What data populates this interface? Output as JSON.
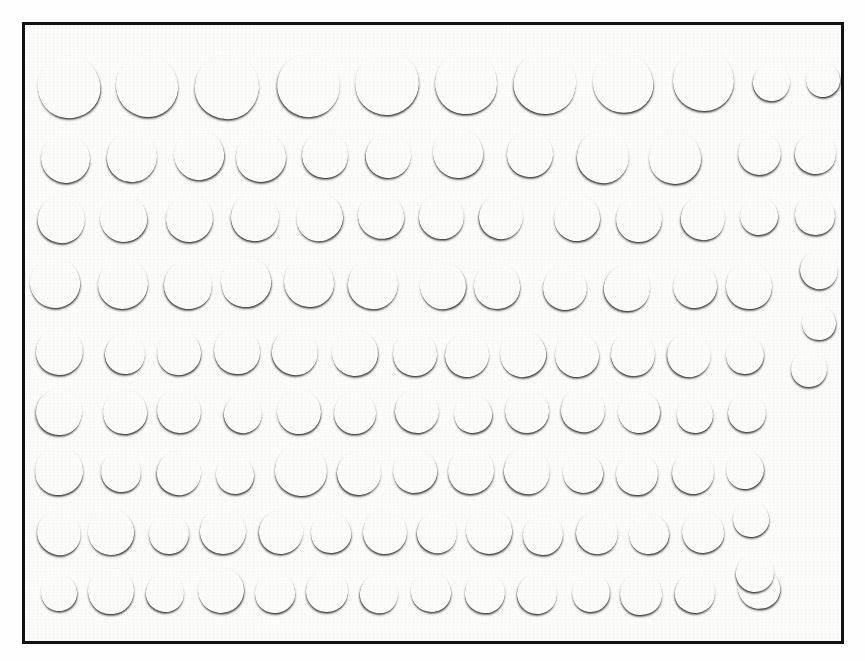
{
  "image": {
    "subject": "coin-hoard-photograph",
    "description": "Monochrome photograph of a hoard of hammered silver coins laid out in rows inside a ruled black rectangular frame",
    "orientation": "landscape",
    "background_color": "#fefefe",
    "frame_color": "#111111",
    "frame": {
      "left": 22,
      "top": 22,
      "width": 822,
      "height": 622,
      "border_width": 3
    },
    "total_coins": 120,
    "row_count": 9
  },
  "palette": {
    "paper": "#fcfcfa",
    "frame": "#111111",
    "coin_light": "#c3c1ba",
    "coin_mid": "#9d9b94",
    "coin_dark": "#74726c",
    "coin_darkest": "#5c5a55",
    "shadow": "rgba(0,0,0,0.55)"
  },
  "rows": [
    {
      "index": 1,
      "label": "row-1",
      "coin_count": 11,
      "note": "nine large coins followed by two small coins at the right",
      "coins": [
        {
          "cx": 66,
          "cy": 84,
          "d": 62,
          "tone": "#b4b2ab",
          "device": "plain"
        },
        {
          "cx": 144,
          "cy": 83,
          "d": 62,
          "tone": "#c2c0b8",
          "device": "bust"
        },
        {
          "cx": 224,
          "cy": 84,
          "d": 64,
          "tone": "#8b8982",
          "device": "plain"
        },
        {
          "cx": 305,
          "cy": 82,
          "d": 63,
          "tone": "#a9a7a0",
          "device": "bust"
        },
        {
          "cx": 384,
          "cy": 80,
          "d": 64,
          "tone": "#b0aea7",
          "device": "bust"
        },
        {
          "cx": 463,
          "cy": 80,
          "d": 62,
          "tone": "#aeaca5",
          "device": "bust"
        },
        {
          "cx": 542,
          "cy": 80,
          "d": 62,
          "tone": "#bcbab2",
          "device": "shield"
        },
        {
          "cx": 620,
          "cy": 80,
          "d": 60,
          "tone": "#838179",
          "device": "plain"
        },
        {
          "cx": 700,
          "cy": 77,
          "d": 61,
          "tone": "#c0beb6",
          "device": "plain"
        },
        {
          "cx": 768,
          "cy": 79,
          "d": 37,
          "tone": "#8c8a83",
          "device": "plain"
        },
        {
          "cx": 820,
          "cy": 77,
          "d": 34,
          "tone": "#908e87",
          "device": "plain"
        }
      ]
    },
    {
      "index": 2,
      "label": "row-2",
      "coin_count": 12,
      "coins": [
        {
          "cx": 62,
          "cy": 155,
          "d": 49,
          "tone": "#bab8b0",
          "device": "plain"
        },
        {
          "cx": 129,
          "cy": 154,
          "d": 50,
          "tone": "#a6a49d",
          "device": "shield"
        },
        {
          "cx": 196,
          "cy": 152,
          "d": 50,
          "tone": "#c0beb6",
          "device": "plain"
        },
        {
          "cx": 258,
          "cy": 154,
          "d": 50,
          "tone": "#9a9891",
          "device": "shield"
        },
        {
          "cx": 322,
          "cy": 152,
          "d": 46,
          "tone": "#b2b0a9",
          "device": "bust"
        },
        {
          "cx": 385,
          "cy": 152,
          "d": 45,
          "tone": "#b6b4ac",
          "device": "bust"
        },
        {
          "cx": 455,
          "cy": 150,
          "d": 50,
          "tone": "#a2a099",
          "device": "bust"
        },
        {
          "cx": 527,
          "cy": 151,
          "d": 46,
          "tone": "#bdbbb3",
          "device": "shield"
        },
        {
          "cx": 600,
          "cy": 154,
          "d": 52,
          "tone": "#8f8d86",
          "device": "cross"
        },
        {
          "cx": 672,
          "cy": 155,
          "d": 52,
          "tone": "#b7b5ad",
          "device": "shield"
        },
        {
          "cx": 756,
          "cy": 150,
          "d": 43,
          "tone": "#9d9b94",
          "device": "bust"
        },
        {
          "cx": 812,
          "cy": 150,
          "d": 41,
          "tone": "#878580",
          "device": "bust"
        }
      ]
    },
    {
      "index": 3,
      "label": "row-3",
      "coin_count": 13,
      "coins": [
        {
          "cx": 58,
          "cy": 216,
          "d": 47,
          "tone": "#a5a39c",
          "device": "plain"
        },
        {
          "cx": 120,
          "cy": 215,
          "d": 47,
          "tone": "#c4c2ba",
          "device": "plain"
        },
        {
          "cx": 186,
          "cy": 215,
          "d": 47,
          "tone": "#aeaca5",
          "device": "plain"
        },
        {
          "cx": 252,
          "cy": 214,
          "d": 48,
          "tone": "#b5b3ab",
          "device": "bust"
        },
        {
          "cx": 316,
          "cy": 214,
          "d": 47,
          "tone": "#9b9992",
          "device": "bust"
        },
        {
          "cx": 378,
          "cy": 213,
          "d": 46,
          "tone": "#8d8b84",
          "device": "plain"
        },
        {
          "cx": 438,
          "cy": 213,
          "d": 45,
          "tone": "#aaa8a1",
          "device": "bust"
        },
        {
          "cx": 498,
          "cy": 214,
          "d": 44,
          "tone": "#98968f",
          "device": "plain"
        },
        {
          "cx": 574,
          "cy": 215,
          "d": 46,
          "tone": "#a19f98",
          "device": "bust"
        },
        {
          "cx": 636,
          "cy": 216,
          "d": 46,
          "tone": "#b0aea6",
          "device": "cross"
        },
        {
          "cx": 700,
          "cy": 215,
          "d": 44,
          "tone": "#a3a19a",
          "device": "bust"
        },
        {
          "cx": 756,
          "cy": 213,
          "d": 38,
          "tone": "#8a8881",
          "device": "plain"
        },
        {
          "cx": 812,
          "cy": 212,
          "d": 40,
          "tone": "#747269",
          "device": "plain"
        }
      ]
    },
    {
      "index": 4,
      "label": "row-4",
      "coin_count": 14,
      "coins": [
        {
          "cx": 52,
          "cy": 280,
          "d": 50,
          "tone": "#8e8c85",
          "device": "plain"
        },
        {
          "cx": 120,
          "cy": 281,
          "d": 50,
          "tone": "#9c9a93",
          "device": "plain"
        },
        {
          "cx": 185,
          "cy": 282,
          "d": 48,
          "tone": "#c3c1b9",
          "device": "plain"
        },
        {
          "cx": 243,
          "cy": 279,
          "d": 50,
          "tone": "#b9b7af",
          "device": "plain"
        },
        {
          "cx": 306,
          "cy": 279,
          "d": 50,
          "tone": "#a8a69f",
          "device": "bust"
        },
        {
          "cx": 370,
          "cy": 281,
          "d": 50,
          "tone": "#929089",
          "device": "plain"
        },
        {
          "cx": 440,
          "cy": 283,
          "d": 46,
          "tone": "#a6a49d",
          "device": "shield"
        },
        {
          "cx": 494,
          "cy": 283,
          "d": 46,
          "tone": "#9a9891",
          "device": "cross"
        },
        {
          "cx": 562,
          "cy": 285,
          "d": 44,
          "tone": "#b1afa8",
          "device": "bust"
        },
        {
          "cx": 624,
          "cy": 285,
          "d": 46,
          "tone": "#a09e97",
          "device": "bust"
        },
        {
          "cx": 692,
          "cy": 283,
          "d": 44,
          "tone": "#7b7972",
          "device": "plain"
        },
        {
          "cx": 746,
          "cy": 283,
          "d": 46,
          "tone": "#87857e",
          "device": "plain"
        },
        {
          "cx": 816,
          "cy": 267,
          "d": 38,
          "tone": "#6e6c66",
          "device": "bust"
        },
        {
          "cx": 816,
          "cy": 320,
          "d": 34,
          "tone": "#6a6862",
          "device": "plain"
        }
      ]
    },
    {
      "index": 5,
      "label": "row-5",
      "coin_count": 14,
      "coins": [
        {
          "cx": 56,
          "cy": 348,
          "d": 47,
          "tone": "#b4b2aa",
          "device": "plain"
        },
        {
          "cx": 122,
          "cy": 351,
          "d": 40,
          "tone": "#a9a7a0",
          "device": "plain"
        },
        {
          "cx": 176,
          "cy": 350,
          "d": 44,
          "tone": "#8f8d86",
          "device": "plain"
        },
        {
          "cx": 234,
          "cy": 348,
          "d": 46,
          "tone": "#9b9992",
          "device": "bust"
        },
        {
          "cx": 292,
          "cy": 349,
          "d": 46,
          "tone": "#a6a49d",
          "device": "plain"
        },
        {
          "cx": 352,
          "cy": 350,
          "d": 46,
          "tone": "#a09e97",
          "device": "bust"
        },
        {
          "cx": 412,
          "cy": 351,
          "d": 44,
          "tone": "#8d8b84",
          "device": "bust"
        },
        {
          "cx": 464,
          "cy": 352,
          "d": 44,
          "tone": "#8a8881",
          "device": "shield"
        },
        {
          "cx": 520,
          "cy": 351,
          "d": 46,
          "tone": "#a3a19a",
          "device": "shield"
        },
        {
          "cx": 574,
          "cy": 352,
          "d": 44,
          "tone": "#97958e",
          "device": "bust"
        },
        {
          "cx": 630,
          "cy": 351,
          "d": 44,
          "tone": "#8b8982",
          "device": "plain"
        },
        {
          "cx": 686,
          "cy": 352,
          "d": 44,
          "tone": "#9f9d96",
          "device": "shield"
        },
        {
          "cx": 742,
          "cy": 352,
          "d": 38,
          "tone": "#a5a39c",
          "device": "cross"
        },
        {
          "cx": 806,
          "cy": 366,
          "d": 36,
          "tone": "#85837c",
          "device": "cross"
        }
      ]
    },
    {
      "index": 6,
      "label": "row-6",
      "coin_count": 13,
      "coins": [
        {
          "cx": 56,
          "cy": 409,
          "d": 46,
          "tone": "#a5a39c",
          "device": "plain"
        },
        {
          "cx": 122,
          "cy": 409,
          "d": 44,
          "tone": "#9a9891",
          "device": "cross"
        },
        {
          "cx": 176,
          "cy": 408,
          "d": 44,
          "tone": "#91908a",
          "device": "bust"
        },
        {
          "cx": 240,
          "cy": 411,
          "d": 38,
          "tone": "#a9a7a0",
          "device": "plain"
        },
        {
          "cx": 296,
          "cy": 409,
          "d": 44,
          "tone": "#9d9b94",
          "device": "bust"
        },
        {
          "cx": 352,
          "cy": 410,
          "d": 42,
          "tone": "#8f8d86",
          "device": "bust"
        },
        {
          "cx": 414,
          "cy": 408,
          "d": 44,
          "tone": "#a19f98",
          "device": "bust"
        },
        {
          "cx": 470,
          "cy": 411,
          "d": 38,
          "tone": "#908e87",
          "device": "plain"
        },
        {
          "cx": 524,
          "cy": 408,
          "d": 44,
          "tone": "#a7a59e",
          "device": "shield"
        },
        {
          "cx": 580,
          "cy": 407,
          "d": 44,
          "tone": "#b3b1a9",
          "device": "bust"
        },
        {
          "cx": 636,
          "cy": 409,
          "d": 42,
          "tone": "#9b9992",
          "device": "shield"
        },
        {
          "cx": 692,
          "cy": 412,
          "d": 36,
          "tone": "#8d8b84",
          "device": "plain"
        },
        {
          "cx": 744,
          "cy": 410,
          "d": 38,
          "tone": "#92908a",
          "device": "bust"
        }
      ]
    },
    {
      "index": 7,
      "label": "row-7",
      "coin_count": 14,
      "coins": [
        {
          "cx": 56,
          "cy": 468,
          "d": 48,
          "tone": "#9f9d96",
          "device": "plain"
        },
        {
          "cx": 118,
          "cy": 469,
          "d": 40,
          "tone": "#a8a69f",
          "device": "plain"
        },
        {
          "cx": 176,
          "cy": 470,
          "d": 44,
          "tone": "#b0aea6",
          "device": "plain"
        },
        {
          "cx": 232,
          "cy": 472,
          "d": 38,
          "tone": "#b9b7af",
          "device": "plain"
        },
        {
          "cx": 298,
          "cy": 467,
          "d": 52,
          "tone": "#c1bfb7",
          "device": "bust"
        },
        {
          "cx": 356,
          "cy": 470,
          "d": 44,
          "tone": "#a09e97",
          "device": "plain"
        },
        {
          "cx": 412,
          "cy": 468,
          "d": 44,
          "tone": "#a9a7a0",
          "device": "cross"
        },
        {
          "cx": 468,
          "cy": 468,
          "d": 46,
          "tone": "#8c8a83",
          "device": "cross"
        },
        {
          "cx": 524,
          "cy": 468,
          "d": 46,
          "tone": "#9e9c95",
          "device": "shield"
        },
        {
          "cx": 580,
          "cy": 470,
          "d": 40,
          "tone": "#898780",
          "device": "plain"
        },
        {
          "cx": 634,
          "cy": 471,
          "d": 42,
          "tone": "#93918a",
          "device": "plain"
        },
        {
          "cx": 690,
          "cy": 470,
          "d": 42,
          "tone": "#8e8c85",
          "device": "plain"
        },
        {
          "cx": 742,
          "cy": 467,
          "d": 38,
          "tone": "#6f6d67",
          "device": "plain"
        },
        {
          "cx": 748,
          "cy": 516,
          "d": 36,
          "tone": "#65635d",
          "device": "plain"
        }
      ]
    },
    {
      "index": 8,
      "label": "row-8",
      "coin_count": 14,
      "coins": [
        {
          "cx": 56,
          "cy": 530,
          "d": 44,
          "tone": "#b5b3ab",
          "device": "plain"
        },
        {
          "cx": 108,
          "cy": 529,
          "d": 46,
          "tone": "#a19f98",
          "device": "plain"
        },
        {
          "cx": 166,
          "cy": 531,
          "d": 40,
          "tone": "#8d8b84",
          "device": "plain"
        },
        {
          "cx": 220,
          "cy": 528,
          "d": 46,
          "tone": "#85837c",
          "device": "cross"
        },
        {
          "cx": 278,
          "cy": 529,
          "d": 44,
          "tone": "#9a9891",
          "device": "plain"
        },
        {
          "cx": 328,
          "cy": 530,
          "d": 40,
          "tone": "#a3a19a",
          "device": "plain"
        },
        {
          "cx": 382,
          "cy": 529,
          "d": 44,
          "tone": "#90908a",
          "device": "bust"
        },
        {
          "cx": 434,
          "cy": 530,
          "d": 40,
          "tone": "#8a8881",
          "device": "bust"
        },
        {
          "cx": 486,
          "cy": 528,
          "d": 46,
          "tone": "#96948d",
          "device": "plain"
        },
        {
          "cx": 540,
          "cy": 532,
          "d": 40,
          "tone": "#b8b6ae",
          "device": "plain"
        },
        {
          "cx": 594,
          "cy": 530,
          "d": 42,
          "tone": "#7c7a73",
          "device": "cross"
        },
        {
          "cx": 646,
          "cy": 531,
          "d": 40,
          "tone": "#b0aea6",
          "device": "bust"
        },
        {
          "cx": 700,
          "cy": 529,
          "d": 42,
          "tone": "#8f8d86",
          "device": "shield"
        },
        {
          "cx": 752,
          "cy": 570,
          "d": 38,
          "tone": "#66645e",
          "device": "plain"
        }
      ]
    },
    {
      "index": 9,
      "label": "row-9",
      "coin_count": 14,
      "coins": [
        {
          "cx": 56,
          "cy": 590,
          "d": 36,
          "tone": "#bcbab2",
          "device": "plain"
        },
        {
          "cx": 108,
          "cy": 588,
          "d": 46,
          "tone": "#b4b2aa",
          "device": "plain"
        },
        {
          "cx": 162,
          "cy": 590,
          "d": 38,
          "tone": "#939189",
          "device": "plain"
        },
        {
          "cx": 218,
          "cy": 587,
          "d": 46,
          "tone": "#a3a19a",
          "device": "cross"
        },
        {
          "cx": 272,
          "cy": 590,
          "d": 40,
          "tone": "#9d9b94",
          "device": "plain"
        },
        {
          "cx": 324,
          "cy": 588,
          "d": 42,
          "tone": "#aaa8a1",
          "device": "plain"
        },
        {
          "cx": 376,
          "cy": 591,
          "d": 38,
          "tone": "#a19f98",
          "device": "plain"
        },
        {
          "cx": 428,
          "cy": 589,
          "d": 40,
          "tone": "#b6b4ac",
          "device": "plain"
        },
        {
          "cx": 482,
          "cy": 590,
          "d": 40,
          "tone": "#8f8d86",
          "device": "plain"
        },
        {
          "cx": 534,
          "cy": 591,
          "d": 40,
          "tone": "#b2b0a8",
          "device": "plain"
        },
        {
          "cx": 588,
          "cy": 590,
          "d": 38,
          "tone": "#99978f",
          "device": "plain"
        },
        {
          "cx": 638,
          "cy": 591,
          "d": 42,
          "tone": "#8b8982",
          "device": "bust"
        },
        {
          "cx": 692,
          "cy": 590,
          "d": 40,
          "tone": "#94928b",
          "device": "plain"
        },
        {
          "cx": 756,
          "cy": 585,
          "d": 42,
          "tone": "#6b6963",
          "device": "plain"
        }
      ]
    }
  ]
}
